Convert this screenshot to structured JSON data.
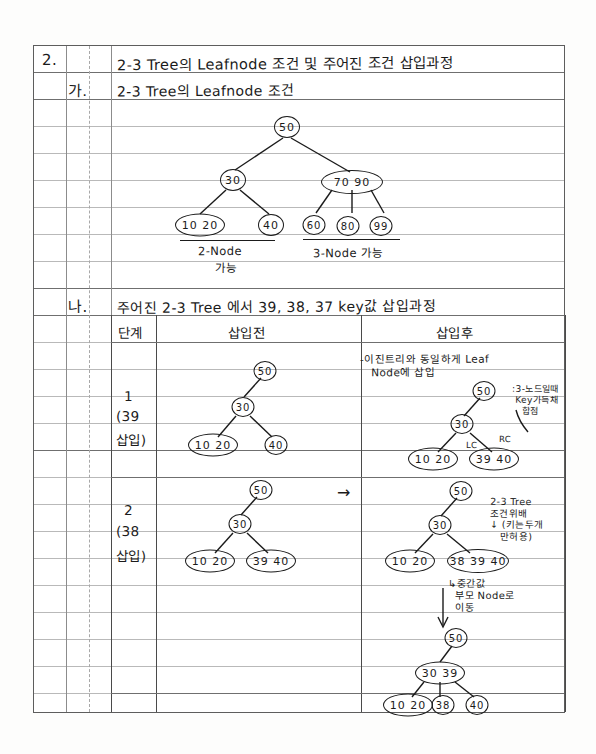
{
  "page": {
    "type": "handwritten-notebook-page",
    "subject": "2-3 Tree",
    "ink_color": "#1b1b1b",
    "rule_color": "#b9b9b9",
    "border_color": "#5d5d5d"
  },
  "outline": {
    "item_number": "2.",
    "item_title": "2-3 Tree의  Leafnode 조건 및 주어진 조건 삽입과정",
    "sub_a_number": "가.",
    "sub_a_title": "2-3 Tree의  Leafnode 조건",
    "sub_b_number": "나.",
    "sub_b_title": "주어진 2-3 Tree 에서 39, 38, 37 key값 삽입과정"
  },
  "leaf_condition_tree": {
    "root": "50",
    "level2": [
      "30",
      "70 90"
    ],
    "level3": [
      "10 20",
      "40",
      "60",
      "80",
      "99"
    ],
    "caption_left": "2-Node",
    "caption_left2": "가능",
    "caption_right": "3-Node 가능"
  },
  "table": {
    "headers": {
      "step": "단계",
      "before": "삽입전",
      "after": "삽입후"
    },
    "rows": [
      {
        "step_number": "1",
        "step_key": "(39",
        "step_key2": "삽입)",
        "before": {
          "root": "50",
          "mid": "30",
          "leaves": [
            "10 20",
            "40"
          ]
        },
        "after_note": "-이진트리와 동일하게 Leaf\n   Node에 삽입",
        "after": {
          "root": "50",
          "mid": "30",
          "leaves": [
            "10 20",
            "39 40"
          ]
        },
        "after_edge_labels": {
          "left": "LC",
          "right": "RC"
        },
        "after_side_note": ":3-노드일때\n Key가득채\n   합점"
      },
      {
        "step_number": "2",
        "step_key": "(38",
        "step_key2": "삽입)",
        "before": {
          "root": "50",
          "mid": "30",
          "leaves": [
            "10 20",
            "39 40"
          ]
        },
        "arrow": "→",
        "after": {
          "root": "50",
          "mid": "30",
          "leaves": [
            "10 20",
            "38 39 40"
          ]
        },
        "after_side_note": "2-3 Tree\n조건위배\n↓ (키는두개\n   만허용)",
        "after_note2": "↳중간값\n  부모 Node로\n  이동",
        "final": {
          "root": "50",
          "mid": "30 39",
          "leaves": [
            "10 20",
            "38",
            "40"
          ]
        }
      }
    ]
  }
}
